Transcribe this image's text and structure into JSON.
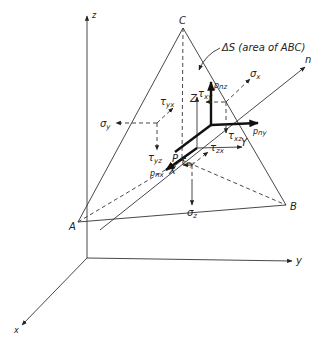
{
  "diagram": {
    "axes": {
      "global_x": "x",
      "global_y": "y",
      "global_z": "z",
      "local_X": "X",
      "local_Y": "Y",
      "local_Z": "Z",
      "normal": "n"
    },
    "vertices": {
      "A": "A",
      "B": "B",
      "C": "C",
      "P": "P"
    },
    "area_annotation": "ΔS (area of ABC)",
    "traction_components": {
      "pnx": "p",
      "pnx_sub": "nx",
      "pny": "p",
      "pny_sub": "ny",
      "pnz": "p",
      "pnz_sub": "nz"
    },
    "stresses": {
      "sigma_x": "σ",
      "sigma_x_sub": "x",
      "sigma_y": "σ",
      "sigma_y_sub": "y",
      "sigma_z": "σ",
      "sigma_z_sub": "z",
      "tau_xy": "τ",
      "tau_xy_sub": "xy",
      "tau_xz": "τ",
      "tau_xz_sub": "xz",
      "tau_yx": "τ",
      "tau_yx_sub": "yx",
      "tau_yz": "τ",
      "tau_yz_sub": "yz",
      "tau_zx": "τ",
      "tau_zx_sub": "zx",
      "tau_zy": "τ",
      "tau_zy_sub": "zy"
    }
  }
}
